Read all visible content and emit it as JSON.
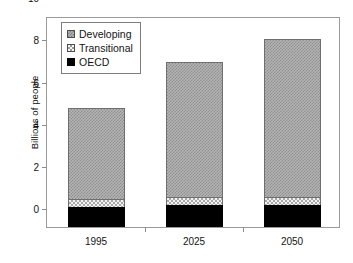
{
  "chart_data": {
    "type": "bar",
    "subtype": "stacked-bar",
    "title": "",
    "xlabel": "",
    "ylabel": "Billions of people",
    "categories": [
      "1995",
      "2025",
      "2050"
    ],
    "series": [
      {
        "name": "OECD",
        "values": [
          0.95,
          1.05,
          1.05
        ],
        "color": "#000000",
        "pattern": "solid"
      },
      {
        "name": "Transitional",
        "values": [
          0.38,
          0.37,
          0.35
        ],
        "color": "#f2f2f2",
        "pattern": "light-dotted"
      },
      {
        "name": "Developing",
        "values": [
          4.31,
          6.38,
          7.5
        ],
        "color": "#b4b4b4",
        "pattern": "gray-checker"
      }
    ],
    "stack_order_bottom_to_top": [
      "OECD",
      "Transitional",
      "Developing"
    ],
    "totals": [
      5.64,
      7.8,
      8.9
    ],
    "ylim": [
      0,
      10
    ],
    "yticks": [
      "0",
      "2",
      "4",
      "6",
      "8",
      "10"
    ],
    "ytick_values": [
      0,
      2,
      4,
      6,
      8,
      10
    ],
    "grid": false,
    "frame": true,
    "legend_position": "top-left-inside",
    "legend_entries": [
      {
        "label": "Developing",
        "swatch": "developing-swatch"
      },
      {
        "label": "Transitional",
        "swatch": "transitional-swatch"
      },
      {
        "label": "OECD",
        "swatch": "oecd-swatch"
      }
    ]
  }
}
